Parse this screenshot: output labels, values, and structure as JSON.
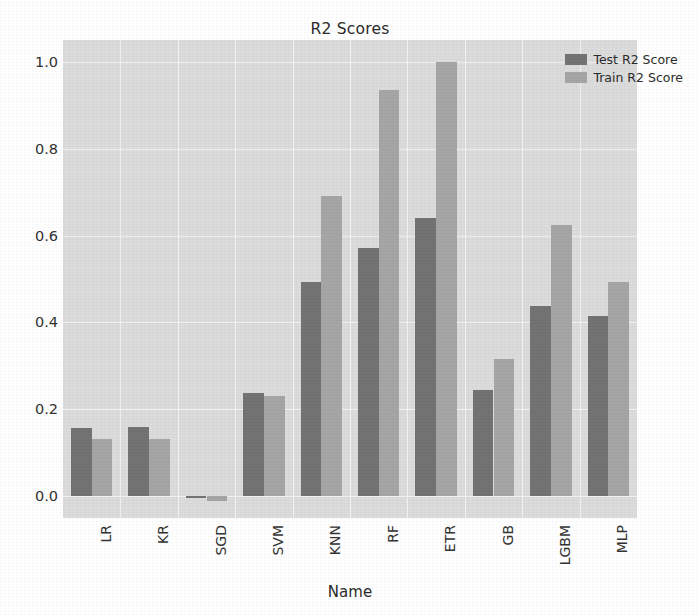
{
  "chart_data": {
    "type": "bar",
    "title": "R2 Scores",
    "xlabel": "Name",
    "ylabel": "",
    "grid": true,
    "legend_position": "upper right",
    "categories": [
      "LR",
      "KR",
      "SGD",
      "SVM",
      "KNN",
      "RF",
      "ETR",
      "GB",
      "LGBM",
      "MLP"
    ],
    "ylim": [
      -0.05,
      1.05
    ],
    "yticks": [
      "0.0",
      "0.2",
      "0.4",
      "0.6",
      "0.8",
      "1.0"
    ],
    "ytick_values": [
      0.0,
      0.2,
      0.4,
      0.6,
      0.8,
      1.0
    ],
    "series": [
      {
        "name": "Test R2 Score",
        "color": "#737373",
        "values": [
          0.157,
          0.159,
          -0.004,
          0.238,
          0.492,
          0.572,
          0.641,
          0.245,
          0.437,
          0.414
        ]
      },
      {
        "name": "Train R2 Score",
        "color": "#a6a6a6",
        "values": [
          0.132,
          0.132,
          -0.01,
          0.231,
          0.691,
          0.936,
          1.0,
          0.315,
          0.624,
          0.494
        ]
      }
    ]
  },
  "figure": {
    "background": "#ffffff",
    "axes_background": "#dcdcdc",
    "grid_color": "#f2f2f2"
  }
}
